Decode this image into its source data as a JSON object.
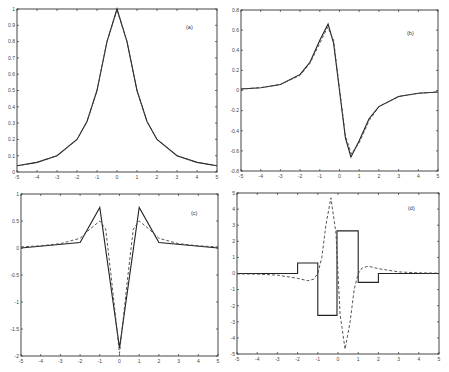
{
  "chart_data": [
    {
      "id": "a",
      "type": "line",
      "panel_label": "(a)",
      "xlim": [
        -5,
        5
      ],
      "ylim": [
        0,
        1
      ],
      "xticks": [
        -5,
        -4,
        -3,
        -2,
        -1,
        0,
        1,
        2,
        3,
        4,
        5
      ],
      "yticks": [
        0,
        0.1,
        0.2,
        0.3,
        0.4,
        0.5,
        0.6,
        0.7,
        0.8,
        0.9,
        1
      ],
      "ytick_labels": [
        "0",
        "0.1",
        "0.2",
        "0.3",
        "0.4",
        "0.5",
        "0.6",
        "0.7",
        "0.8",
        "0.9",
        "1"
      ],
      "frame": {
        "x": 17,
        "y": 9,
        "w": 200,
        "h": 163
      },
      "label_pos": {
        "x": 186,
        "y": 29
      },
      "series": [
        {
          "name": "solid",
          "style": "solid",
          "x": [
            -5,
            -4,
            -3,
            -2,
            -1.5,
            -1,
            -0.5,
            0,
            0.5,
            1,
            1.5,
            2,
            3,
            4,
            5
          ],
          "y": [
            0.038,
            0.059,
            0.1,
            0.2,
            0.31,
            0.5,
            0.8,
            1.0,
            0.8,
            0.5,
            0.31,
            0.2,
            0.1,
            0.059,
            0.038
          ]
        },
        {
          "name": "dashed",
          "style": "dashed",
          "x": [
            -5,
            -4,
            -3,
            -2,
            -1.5,
            -1,
            -0.5,
            0,
            0.5,
            1,
            1.5,
            2,
            3,
            4,
            5
          ],
          "y": [
            0.038,
            0.059,
            0.1,
            0.2,
            0.31,
            0.5,
            0.8,
            0.995,
            0.8,
            0.5,
            0.31,
            0.2,
            0.1,
            0.059,
            0.038
          ]
        }
      ]
    },
    {
      "id": "b",
      "type": "line",
      "panel_label": "(b)",
      "xlim": [
        -5,
        5
      ],
      "ylim": [
        -0.8,
        0.8
      ],
      "xticks": [
        -5,
        -4,
        -3,
        -2,
        -1,
        0,
        1,
        2,
        3,
        4,
        5
      ],
      "yticks": [
        -0.8,
        -0.6,
        -0.4,
        -0.2,
        0,
        0.2,
        0.4,
        0.6,
        0.8
      ],
      "ytick_labels": [
        "-0.8",
        "-0.6",
        "-0.4",
        "-0.2",
        "0",
        "0.2",
        "0.4",
        "0.6",
        "0.8"
      ],
      "frame": {
        "x": 241,
        "y": 10,
        "w": 197,
        "h": 161
      },
      "label_pos": {
        "x": 407,
        "y": 35
      },
      "series": [
        {
          "name": "solid",
          "style": "solid",
          "x": [
            -5,
            -4,
            -3,
            -2,
            -1.5,
            -1,
            -0.58,
            -0.3,
            0,
            0.3,
            0.58,
            1,
            1.5,
            2,
            3,
            4,
            5
          ],
          "y": [
            0.015,
            0.028,
            0.06,
            0.16,
            0.28,
            0.5,
            0.66,
            0.47,
            0,
            -0.47,
            -0.66,
            -0.5,
            -0.28,
            -0.16,
            -0.06,
            -0.028,
            -0.015
          ]
        },
        {
          "name": "dashed",
          "style": "dashed",
          "x": [
            -5,
            -4,
            -3,
            -2,
            -1.5,
            -1,
            -0.6,
            -0.3,
            0,
            0.3,
            0.6,
            1,
            1.5,
            2,
            3,
            4,
            5
          ],
          "y": [
            0.015,
            0.028,
            0.06,
            0.15,
            0.27,
            0.47,
            0.63,
            0.5,
            0.02,
            -0.45,
            -0.63,
            -0.52,
            -0.3,
            -0.16,
            -0.06,
            -0.028,
            -0.015
          ]
        }
      ]
    },
    {
      "id": "c",
      "type": "line",
      "panel_label": "(c)",
      "xlim": [
        -5,
        5
      ],
      "ylim": [
        -2,
        1
      ],
      "xticks": [
        -5,
        -4,
        -3,
        -2,
        -1,
        0,
        1,
        2,
        3,
        4,
        5
      ],
      "yticks": [
        -2,
        -1.5,
        -1,
        -0.5,
        0,
        0.5,
        1
      ],
      "ytick_labels": [
        "-2",
        "-1.5",
        "-1",
        "-0.5",
        "0",
        "0.5",
        "1"
      ],
      "frame": {
        "x": 21,
        "y": 194,
        "w": 197,
        "h": 162
      },
      "label_pos": {
        "x": 191,
        "y": 215
      },
      "series": [
        {
          "name": "solid",
          "style": "solid",
          "x": [
            -5,
            -2,
            -1,
            0,
            1,
            2,
            5
          ],
          "y": [
            0.0,
            0.1,
            0.75,
            -1.85,
            0.75,
            0.1,
            0.0
          ]
        },
        {
          "name": "dashed",
          "style": "dashed",
          "x": [
            -5,
            -4,
            -3,
            -2,
            -1.5,
            -1,
            -0.7,
            -0.4,
            0,
            0.4,
            0.7,
            1,
            1.5,
            2,
            3,
            4,
            5
          ],
          "y": [
            0.02,
            0.04,
            0.08,
            0.18,
            0.35,
            0.5,
            0.35,
            -0.6,
            -1.95,
            -0.6,
            0.35,
            0.5,
            0.35,
            0.18,
            0.08,
            0.04,
            0.02
          ]
        }
      ]
    },
    {
      "id": "d",
      "type": "line",
      "panel_label": "(d)",
      "xlim": [
        -5,
        5
      ],
      "ylim": [
        -5,
        5
      ],
      "xticks": [
        -5,
        -4,
        -3,
        -2,
        -1,
        0,
        1,
        2,
        3,
        4,
        5
      ],
      "yticks": [
        -5,
        -4,
        -3,
        -2,
        -1,
        0,
        1,
        2,
        3,
        4,
        5
      ],
      "ytick_labels": [
        "-5",
        "-4",
        "-3",
        "-2",
        "-1",
        "0",
        "1",
        "2",
        "3",
        "4",
        "5"
      ],
      "frame": {
        "x": 237,
        "y": 193,
        "w": 202,
        "h": 161
      },
      "label_pos": {
        "x": 408,
        "y": 210
      },
      "series": [
        {
          "name": "solid",
          "style": "solid",
          "x": [
            -5,
            -2,
            -2,
            -1,
            -1,
            -0.05,
            -0.05,
            1,
            1,
            2,
            2,
            5
          ],
          "y": [
            0,
            0,
            0.65,
            0.65,
            -2.6,
            -2.6,
            2.65,
            2.65,
            -0.55,
            -0.55,
            0,
            0
          ]
        },
        {
          "name": "dashed",
          "style": "dashed",
          "x": [
            -5,
            -4,
            -3,
            -2,
            -1.5,
            -1.2,
            -1,
            -0.8,
            -0.6,
            -0.35,
            -0.1,
            0,
            0.1,
            0.35,
            0.6,
            0.8,
            1,
            1.2,
            1.5,
            2,
            3,
            4,
            5
          ],
          "y": [
            -0.02,
            -0.04,
            -0.1,
            -0.3,
            -0.45,
            -0.35,
            0,
            1.0,
            3.0,
            4.7,
            2.5,
            0,
            -2.5,
            -4.7,
            -3.0,
            -1.0,
            0,
            0.35,
            0.45,
            0.3,
            0.1,
            0.04,
            0.02
          ]
        }
      ]
    }
  ]
}
